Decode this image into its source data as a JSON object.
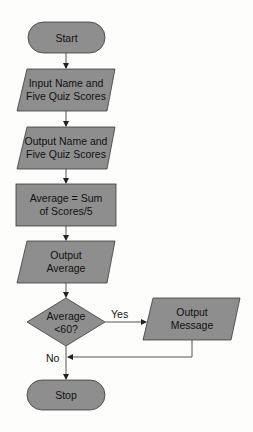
{
  "diagram": {
    "type": "flowchart",
    "colors": {
      "shape_fill": "#8e8e8e",
      "stroke": "#3a3a3a",
      "connector": "#555555",
      "background": "#fdfdfc"
    },
    "nodes": [
      {
        "id": "start",
        "shape": "terminator",
        "lines": [
          "Start"
        ]
      },
      {
        "id": "input",
        "shape": "parallelogram",
        "lines": [
          "Input Name and",
          "Five Quiz Scores"
        ]
      },
      {
        "id": "output1",
        "shape": "parallelogram",
        "lines": [
          "Output Name and",
          "Five Quiz Scores"
        ]
      },
      {
        "id": "process",
        "shape": "rectangle",
        "lines": [
          "Average = Sum",
          "of Scores/5"
        ]
      },
      {
        "id": "output2",
        "shape": "parallelogram",
        "lines": [
          "Output",
          "Average"
        ]
      },
      {
        "id": "decision",
        "shape": "diamond",
        "lines": [
          "Average",
          "<60?"
        ]
      },
      {
        "id": "output3",
        "shape": "parallelogram",
        "lines": [
          "Output",
          "Message"
        ]
      },
      {
        "id": "stop",
        "shape": "terminator",
        "lines": [
          "Stop"
        ]
      }
    ],
    "edges": [
      {
        "from": "start",
        "to": "input",
        "label": ""
      },
      {
        "from": "input",
        "to": "output1",
        "label": ""
      },
      {
        "from": "output1",
        "to": "process",
        "label": ""
      },
      {
        "from": "process",
        "to": "output2",
        "label": ""
      },
      {
        "from": "output2",
        "to": "decision",
        "label": ""
      },
      {
        "from": "decision",
        "to": "output3",
        "label": "Yes"
      },
      {
        "from": "decision",
        "to": "stop",
        "label": "No"
      },
      {
        "from": "output3",
        "to": "stop",
        "label": ""
      }
    ]
  }
}
